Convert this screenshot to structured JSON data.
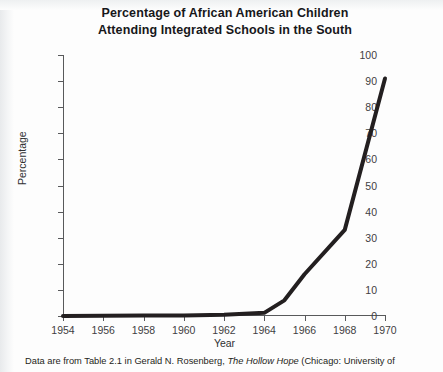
{
  "figure": {
    "title_line1": "Percentage of African American Children",
    "title_line2": "Attending Integrated Schools in the South",
    "caption_before_italic": "Data are from Table 2.1 in Gerald N. Rosenberg, ",
    "caption_italic": "The Hollow Hope",
    "caption_after_italic": " (Chicago: University of"
  },
  "colors": {
    "line": "#231f20",
    "axis": "#58595b",
    "text": "#1d1e20",
    "background": "#fdfdfd"
  },
  "chart_data": {
    "type": "line",
    "title": "Percentage of African American Children Attending Integrated Schools in the South",
    "xlabel": "Year",
    "ylabel": "Percentage",
    "xlim": [
      1954,
      1970
    ],
    "ylim": [
      0,
      100
    ],
    "grid": false,
    "legend": false,
    "x_tick_labels": [
      "1954",
      "1956",
      "1958",
      "1960",
      "1962",
      "1964",
      "1966",
      "1968",
      "1970"
    ],
    "x_ticks": [
      1954,
      1956,
      1958,
      1960,
      1962,
      1964,
      1966,
      1968,
      1970
    ],
    "y_tick_labels": [
      "0",
      "10",
      "20",
      "30",
      "40",
      "50",
      "60",
      "70",
      "80",
      "90",
      "100"
    ],
    "y_ticks": [
      0,
      10,
      20,
      30,
      40,
      50,
      60,
      70,
      80,
      90,
      100
    ],
    "x": [
      1954,
      1956,
      1958,
      1960,
      1962,
      1964,
      1965,
      1966,
      1968,
      1970
    ],
    "values": [
      0,
      0.1,
      0.2,
      0.2,
      0.5,
      1.2,
      6,
      16,
      33,
      91
    ],
    "series": [
      {
        "name": "Percentage integrated",
        "x": [
          1954,
          1956,
          1958,
          1960,
          1962,
          1964,
          1965,
          1966,
          1968,
          1970
        ],
        "values": [
          0,
          0.1,
          0.2,
          0.2,
          0.5,
          1.2,
          6,
          16,
          33,
          91
        ]
      }
    ]
  }
}
